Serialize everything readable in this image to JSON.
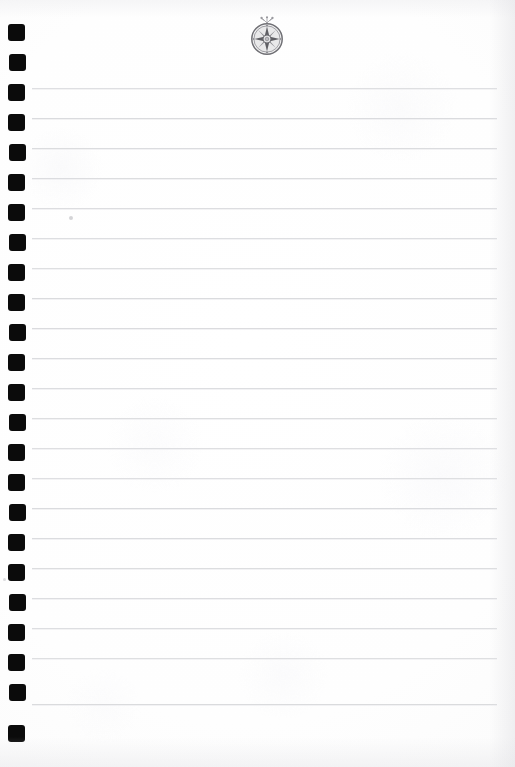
{
  "document": {
    "kind": "lined-notebook-page",
    "title": "Blank Ruled Notebook Page",
    "page_width": 515,
    "page_height": 767,
    "background_color": "#ffffff",
    "content_text": "",
    "is_blank": true
  },
  "emblem": {
    "name": "compass-rose-medallion",
    "description": "Circular medallion with eight-pointed compass rose star",
    "center_x": 267,
    "center_y": 38,
    "diameter": 34,
    "color": "#8a8a8e",
    "ink_color": "#6e6e73",
    "has_top_flourish": true
  },
  "ruling": {
    "line_color": "#d8d9dc",
    "line_thickness": 1,
    "line_start_x": 32,
    "line_end_x": 497,
    "first_line_y": 88,
    "line_spacing": 30,
    "line_count": 21,
    "lines_y": [
      88,
      118,
      148,
      178,
      208,
      238,
      268,
      298,
      328,
      358,
      388,
      418,
      448,
      478,
      508,
      538,
      568,
      598,
      628,
      658,
      704
    ]
  },
  "binding": {
    "name": "spiral-punch-holes",
    "hole_color": "#0b0b0b",
    "hole_width": 17,
    "hole_height": 17,
    "hole_x": 8,
    "first_hole_y": 24,
    "hole_spacing": 30,
    "hole_count": 24,
    "holes_y": [
      24,
      54,
      84,
      114,
      144,
      174,
      204,
      234,
      264,
      294,
      324,
      354,
      384,
      414,
      444,
      474,
      504,
      534,
      564,
      594,
      624,
      654,
      684,
      725
    ]
  },
  "margins": {
    "left_margin_x": 32,
    "right_margin_x": 497,
    "top_margin_y": 88,
    "bottom_margin_y": 704
  }
}
